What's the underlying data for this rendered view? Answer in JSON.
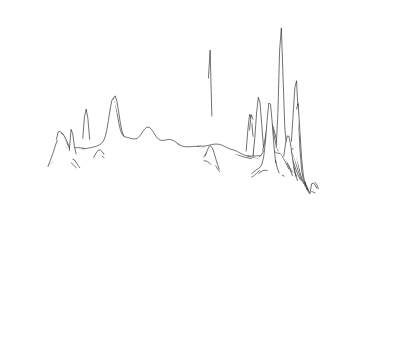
{
  "figure": {
    "title": "",
    "subtitle": "",
    "background_color": "#ffffff",
    "line_color": "#1a1a1a",
    "fill_color": "#ffffff",
    "width": 415,
    "height": 363,
    "render_style": "hidden-line-removal stacked profile surface",
    "icon_name": "surface-plot-icon"
  },
  "chart_data": {
    "type": "line",
    "plot_kind": "3d-surface-ridgeline",
    "title": "",
    "xlabel": "",
    "ylabel": "",
    "zlabel": "",
    "legend": [],
    "grid": false,
    "axes_visible": false,
    "tick_labels": [],
    "projection": {
      "rows": 58,
      "cols": 150,
      "row_step_y": 2.42,
      "row_shear_x": 1.62,
      "origin_x": 28,
      "origin_y": 152,
      "base_width": 258,
      "z_scale": 1.0,
      "description": "Oblique parallel projection; each data row drawn back-to-front with occlusion by running silhouette."
    },
    "grid_extent": {
      "x_min": 0,
      "x_max": 1,
      "y_min": 0,
      "y_max": 1,
      "z_min": 0,
      "z_max": 1
    },
    "baseline_terrain": {
      "description": "Low rolling plateau mask shaped like the contiguous United States outline; mean elevation rises toward the back-left and falls to the front-right.",
      "mean_level": 0.085,
      "roughness_amplitude": 0.055,
      "roughness_frequency": [
        7.0,
        5.0
      ],
      "secondary_roughness_amplitude": 0.03,
      "secondary_roughness_frequency": [
        17.0,
        13.0
      ]
    },
    "mask_outline": {
      "description": "Normalized (u,v) polygon approximating the contiguous US silhouette used to clip the surface; u=0 west, u=1 east, v=0 north/back, v=1 south/front.",
      "points": [
        [
          0.03,
          0.12
        ],
        [
          0.09,
          0.05
        ],
        [
          0.3,
          0.03
        ],
        [
          0.56,
          0.022
        ],
        [
          0.76,
          0.03
        ],
        [
          0.9,
          0.06
        ],
        [
          0.96,
          0.12
        ],
        [
          0.985,
          0.22
        ],
        [
          0.98,
          0.33
        ],
        [
          0.94,
          0.42
        ],
        [
          0.9,
          0.48
        ],
        [
          0.86,
          0.56
        ],
        [
          0.82,
          0.64
        ],
        [
          0.79,
          0.74
        ],
        [
          0.76,
          0.84
        ],
        [
          0.73,
          0.93
        ],
        [
          0.7,
          0.99
        ],
        [
          0.66,
          0.93
        ],
        [
          0.64,
          0.8
        ],
        [
          0.61,
          0.7
        ],
        [
          0.56,
          0.66
        ],
        [
          0.47,
          0.65
        ],
        [
          0.38,
          0.66
        ],
        [
          0.3,
          0.69
        ],
        [
          0.23,
          0.72
        ],
        [
          0.17,
          0.69
        ],
        [
          0.12,
          0.6
        ],
        [
          0.08,
          0.48
        ],
        [
          0.05,
          0.34
        ],
        [
          0.03,
          0.22
        ]
      ]
    },
    "peaks": [
      {
        "name": "west-coast-major-spike",
        "u": 0.055,
        "v": 0.305,
        "height": 0.96,
        "sharpness": 0.012,
        "label": ""
      },
      {
        "name": "west-coast-secondary-spike",
        "u": 0.1,
        "v": 0.355,
        "height": 0.47,
        "sharpness": 0.016,
        "label": ""
      },
      {
        "name": "west-coast-tertiary",
        "u": 0.035,
        "v": 0.43,
        "height": 0.22,
        "sharpness": 0.02,
        "label": ""
      },
      {
        "name": "pacific-northwest-bump",
        "u": 0.075,
        "v": 0.15,
        "height": 0.14,
        "sharpness": 0.03,
        "label": ""
      },
      {
        "name": "mountain-west-bump-a",
        "u": 0.19,
        "v": 0.25,
        "height": 0.115,
        "sharpness": 0.028,
        "label": ""
      },
      {
        "name": "mountain-west-bump-b",
        "u": 0.25,
        "v": 0.42,
        "height": 0.12,
        "sharpness": 0.03,
        "label": ""
      },
      {
        "name": "north-plains-peak",
        "u": 0.305,
        "v": 0.08,
        "height": 0.36,
        "sharpness": 0.02,
        "label": ""
      },
      {
        "name": "southwest-bump",
        "u": 0.155,
        "v": 0.53,
        "height": 0.15,
        "sharpness": 0.026,
        "label": ""
      },
      {
        "name": "south-central-bump-a",
        "u": 0.3,
        "v": 0.6,
        "height": 0.16,
        "sharpness": 0.026,
        "label": ""
      },
      {
        "name": "south-central-bump-b",
        "u": 0.38,
        "v": 0.56,
        "height": 0.175,
        "sharpness": 0.024,
        "label": ""
      },
      {
        "name": "central-plains-bump",
        "u": 0.42,
        "v": 0.4,
        "height": 0.13,
        "sharpness": 0.028,
        "label": ""
      },
      {
        "name": "gulf-coast-bump",
        "u": 0.47,
        "v": 0.64,
        "height": 0.21,
        "sharpness": 0.024,
        "label": ""
      },
      {
        "name": "midwest-major-spike",
        "u": 0.585,
        "v": 0.33,
        "height": 0.985,
        "sharpness": 0.0085,
        "label": ""
      },
      {
        "name": "midwest-secondary",
        "u": 0.545,
        "v": 0.47,
        "height": 0.25,
        "sharpness": 0.022,
        "label": ""
      },
      {
        "name": "great-lakes-bump",
        "u": 0.62,
        "v": 0.245,
        "height": 0.175,
        "sharpness": 0.024,
        "label": ""
      },
      {
        "name": "ohio-valley-bump-a",
        "u": 0.66,
        "v": 0.43,
        "height": 0.23,
        "sharpness": 0.022,
        "label": ""
      },
      {
        "name": "ohio-valley-bump-b",
        "u": 0.7,
        "v": 0.52,
        "height": 0.26,
        "sharpness": 0.02,
        "label": ""
      },
      {
        "name": "southeast-bump",
        "u": 0.64,
        "v": 0.64,
        "height": 0.195,
        "sharpness": 0.024,
        "label": ""
      },
      {
        "name": "appalachian-spike-a",
        "u": 0.735,
        "v": 0.36,
        "height": 0.56,
        "sharpness": 0.014,
        "label": ""
      },
      {
        "name": "appalachian-spike-b",
        "u": 0.775,
        "v": 0.33,
        "height": 0.52,
        "sharpness": 0.015,
        "label": ""
      },
      {
        "name": "mid-atlantic-spike",
        "u": 0.83,
        "v": 0.3,
        "height": 0.455,
        "sharpness": 0.015,
        "label": ""
      },
      {
        "name": "mid-atlantic-bump",
        "u": 0.87,
        "v": 0.39,
        "height": 0.33,
        "sharpness": 0.019,
        "label": ""
      },
      {
        "name": "northeast-tallest-spike",
        "u": 0.905,
        "v": 0.215,
        "height": 1.0,
        "sharpness": 0.01,
        "label": ""
      },
      {
        "name": "northeast-secondary-spike",
        "u": 0.945,
        "v": 0.27,
        "height": 0.66,
        "sharpness": 0.014,
        "label": ""
      },
      {
        "name": "northeast-tertiary",
        "u": 0.88,
        "v": 0.165,
        "height": 0.3,
        "sharpness": 0.02,
        "label": ""
      },
      {
        "name": "coastal-island-blob",
        "u": 0.985,
        "v": 0.345,
        "height": 0.135,
        "sharpness": 0.022,
        "label": ""
      },
      {
        "name": "florida-peninsula-ridge",
        "u": 0.7,
        "v": 0.9,
        "height": 0.3,
        "sharpness": 0.018,
        "label": ""
      },
      {
        "name": "florida-tip-spike",
        "u": 0.672,
        "v": 0.96,
        "height": 0.23,
        "sharpness": 0.015,
        "label": ""
      },
      {
        "name": "gulf-southtip-spike",
        "u": 0.712,
        "v": 0.935,
        "height": 0.21,
        "sharpness": 0.016,
        "label": ""
      },
      {
        "name": "texas-gulf-bump",
        "u": 0.52,
        "v": 0.7,
        "height": 0.155,
        "sharpness": 0.026,
        "label": ""
      },
      {
        "name": "lower-left-edge-bump",
        "u": 0.21,
        "v": 0.68,
        "height": 0.14,
        "sharpness": 0.026,
        "label": ""
      },
      {
        "name": "back-ridge-bump",
        "u": 0.44,
        "v": 0.06,
        "height": 0.11,
        "sharpness": 0.03,
        "label": ""
      }
    ]
  },
  "accessibility": {
    "alt_text": "Three-dimensional hidden-line surface plot of population density across the contiguous United States. Dozens of closely spaced horizontal profile lines form a shaded gray plateau whose silhouette resembles the map of the country, punctuated by tall narrow spikes at major metropolitan areas on the west coast, the midwest, and the northeast.",
    "caption": ""
  }
}
